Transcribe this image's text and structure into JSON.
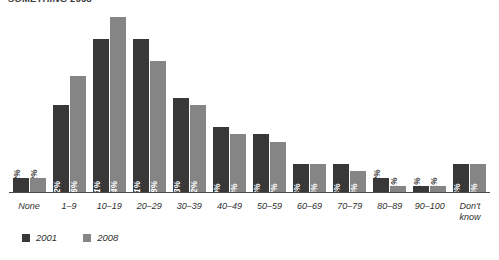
{
  "title": "SOMETHING 2008",
  "colors": {
    "series_2001": "#383838",
    "series_2008": "#858585",
    "axis": "#4a4a4a",
    "text": "#2f2f2f",
    "label_inside": "#ffffff"
  },
  "legend": {
    "items": [
      {
        "label": "2001",
        "color": "#383838",
        "swatch": "square-swatch"
      },
      {
        "label": "2008",
        "color": "#858585",
        "swatch": "square-swatch"
      }
    ]
  },
  "chart_data": {
    "type": "bar",
    "title": "",
    "xlabel": "",
    "ylabel": "",
    "ylim": [
      0,
      25
    ],
    "grid": false,
    "legend_position": "bottom-left",
    "categories": [
      "None",
      "1–9",
      "10–19",
      "20–29",
      "30–39",
      "40–49",
      "50–59",
      "60–69",
      "70–79",
      "80–89",
      "90–100",
      "Don't\nknow"
    ],
    "series": [
      {
        "name": "2001",
        "color": "#383838",
        "values": [
          2,
          12,
          21,
          21,
          13,
          9,
          8,
          4,
          4,
          2,
          1,
          4
        ],
        "value_labels": [
          "2%",
          "12%",
          "21%",
          "21%",
          "13%",
          "9%",
          "8%",
          "4%",
          "4%",
          "2%",
          "1%",
          "4%"
        ],
        "label_placement": [
          "outside",
          "inside",
          "inside",
          "inside",
          "inside",
          "inside",
          "inside",
          "inside",
          "inside",
          "outside",
          "outside",
          "inside"
        ]
      },
      {
        "name": "2008",
        "color": "#858585",
        "values": [
          2,
          16,
          24,
          18,
          12,
          8,
          7,
          4,
          3,
          1,
          1,
          4
        ],
        "value_labels": [
          "2%",
          "16%",
          "24%",
          "18%",
          "12%",
          "8%",
          "7%",
          "4%",
          "3%",
          "1%",
          "1%",
          "4%"
        ],
        "label_placement": [
          "outside",
          "inside",
          "inside",
          "inside",
          "inside",
          "inside",
          "inside",
          "inside",
          "inside",
          "outside",
          "outside",
          "inside"
        ]
      }
    ]
  }
}
